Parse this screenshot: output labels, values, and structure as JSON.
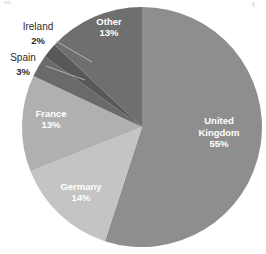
{
  "chart_data": {
    "type": "pie",
    "title": "",
    "subtitle": "",
    "xlabel": "",
    "ylabel": "",
    "legend_position": "none",
    "grid": false,
    "start_angle_deg": 0,
    "direction": "clockwise",
    "center": {
      "x": 142,
      "y": 127
    },
    "radius": 120,
    "total_percent": 100,
    "categories": [
      "United Kingdom",
      "Germany",
      "France",
      "Spain",
      "Ireland",
      "Other"
    ],
    "values": [
      55,
      14,
      13,
      3,
      2,
      13
    ],
    "slices": [
      {
        "label": "United Kingdom",
        "value": 55,
        "percent_text": "55%",
        "label_lines": [
          "United",
          "Kingdom"
        ],
        "color": "#8e8e8e",
        "label_placement": "inside",
        "label_color": "#ffffff",
        "label_x": 219,
        "label_y": 133,
        "start_deg": 0,
        "end_deg": 198
      },
      {
        "label": "Germany",
        "value": 14,
        "percent_text": "14%",
        "label_lines": [
          "Germany"
        ],
        "color": "#c4c4c4",
        "label_placement": "inside",
        "label_color": "#ffffff",
        "label_x": 81,
        "label_y": 193,
        "start_deg": 198,
        "end_deg": 248.4
      },
      {
        "label": "France",
        "value": 13,
        "percent_text": "13%",
        "label_lines": [
          "France"
        ],
        "color": "#b0b0b0",
        "label_placement": "inside",
        "label_color": "#ffffff",
        "label_x": 51,
        "label_y": 120,
        "start_deg": 248.4,
        "end_deg": 295.2
      },
      {
        "label": "Spain",
        "value": 3,
        "percent_text": "3%",
        "label_lines": [
          "Spain"
        ],
        "color": "#6a6a6a",
        "label_placement": "outside",
        "label_color": "#2b2b2b",
        "label_x": 23,
        "label_y": 58,
        "pct_x": 23,
        "pct_y": 72,
        "leader": {
          "x1": 46,
          "y1": 66,
          "x2": 85,
          "y2": 80
        },
        "start_deg": 295.2,
        "end_deg": 306
      },
      {
        "label": "Ireland",
        "value": 2,
        "percent_text": "2%",
        "label_lines": [
          "Ireland"
        ],
        "color": "#585858",
        "label_placement": "outside",
        "label_color": "#2b2b2b",
        "label_x": 38,
        "label_y": 27,
        "pct_x": 38,
        "pct_y": 41,
        "leader": {
          "x1": 56,
          "y1": 41,
          "x2": 92,
          "y2": 62
        },
        "start_deg": 306,
        "end_deg": 313.2
      },
      {
        "label": "Other",
        "value": 13,
        "percent_text": "13%",
        "label_lines": [
          "Other"
        ],
        "color": "#6f6f6f",
        "label_placement": "inside",
        "label_color": "#ffffff",
        "label_x": 109,
        "label_y": 28,
        "start_deg": 313.2,
        "end_deg": 360
      }
    ],
    "palette": {
      "background": "#ffffff",
      "united_kingdom": "#8e8e8e",
      "germany": "#c4c4c4",
      "france": "#b0b0b0",
      "spain": "#6a6a6a",
      "ireland": "#585858",
      "other": "#6f6f6f",
      "inside_label": "#ffffff",
      "outside_label": "#2b2b2b",
      "leader_line": "#b9b9b9"
    }
  }
}
